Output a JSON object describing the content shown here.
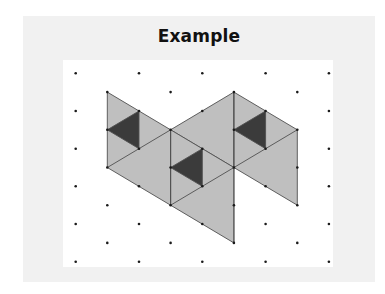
{
  "title": "Example",
  "colors": {
    "frame_bg": "#f1f1f1",
    "panel_bg": "#ffffff",
    "light_fill": "#bfbfbf",
    "dark_fill": "#3b3b3b",
    "line": "#505050",
    "dot": "#1a1a1a"
  },
  "lattice": {
    "origin_x": 75.7,
    "origin_y": 73.3,
    "step_x": 31.65,
    "step_y": 18.84,
    "i_max": 8,
    "j_max": 10,
    "dots_where": "i+j even"
  },
  "shapes": {
    "light_regions": [
      {
        "name": "left-parallelogram",
        "points": [
          [
            1,
            1
          ],
          [
            3,
            3
          ],
          [
            3,
            7
          ],
          [
            1,
            5
          ]
        ]
      },
      {
        "name": "middle-top-triangle",
        "points": [
          [
            3,
            3
          ],
          [
            5,
            1
          ],
          [
            5,
            5
          ]
        ]
      },
      {
        "name": "middle-parallelogram",
        "points": [
          [
            3,
            3
          ],
          [
            5,
            5
          ],
          [
            5,
            9
          ],
          [
            3,
            7
          ]
        ]
      },
      {
        "name": "right-parallelogram",
        "points": [
          [
            5,
            1
          ],
          [
            7,
            3
          ],
          [
            7,
            7
          ],
          [
            5,
            5
          ]
        ]
      }
    ],
    "dark_triangles": [
      {
        "name": "left-dark-triangle",
        "points": [
          [
            1,
            3
          ],
          [
            2,
            2
          ],
          [
            2,
            4
          ]
        ]
      },
      {
        "name": "middle-dark-triangle",
        "points": [
          [
            3,
            5
          ],
          [
            4,
            4
          ],
          [
            4,
            6
          ]
        ]
      },
      {
        "name": "right-dark-triangle",
        "points": [
          [
            5,
            3
          ],
          [
            6,
            2
          ],
          [
            6,
            4
          ]
        ]
      }
    ],
    "internal_lines": [
      [
        [
          1,
          5
        ],
        [
          2,
          4
        ]
      ],
      [
        [
          2,
          4
        ],
        [
          3,
          3
        ]
      ],
      [
        [
          3,
          7
        ],
        [
          4,
          6
        ]
      ],
      [
        [
          4,
          6
        ],
        [
          5,
          5
        ]
      ],
      [
        [
          5,
          5
        ],
        [
          6,
          4
        ]
      ],
      [
        [
          6,
          4
        ],
        [
          7,
          3
        ]
      ],
      [
        [
          3,
          3
        ],
        [
          3,
          7
        ]
      ],
      [
        [
          5,
          1
        ],
        [
          5,
          9
        ]
      ]
    ]
  }
}
